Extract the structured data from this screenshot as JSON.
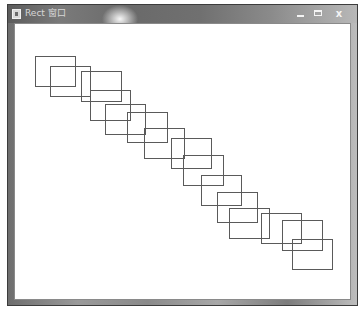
{
  "window": {
    "title": "Rect 窗口",
    "controls": {
      "minimize_icon": "minimize-icon",
      "maximize_icon": "maximize-icon",
      "close_icon": "close-icon",
      "close_glyph": "x"
    }
  },
  "canvas": {
    "stroke_color": "#5a5a5a",
    "rect_width": 40,
    "rect_height": 30,
    "rectangles": [
      {
        "x": 34,
        "y": 55
      },
      {
        "x": 49,
        "y": 65
      },
      {
        "x": 80,
        "y": 70
      },
      {
        "x": 89,
        "y": 89
      },
      {
        "x": 104,
        "y": 103
      },
      {
        "x": 126,
        "y": 111
      },
      {
        "x": 143,
        "y": 127
      },
      {
        "x": 170,
        "y": 137
      },
      {
        "x": 182,
        "y": 154
      },
      {
        "x": 200,
        "y": 174
      },
      {
        "x": 216,
        "y": 191
      },
      {
        "x": 228,
        "y": 207
      },
      {
        "x": 260,
        "y": 212
      },
      {
        "x": 281,
        "y": 219
      },
      {
        "x": 291,
        "y": 238
      }
    ]
  }
}
